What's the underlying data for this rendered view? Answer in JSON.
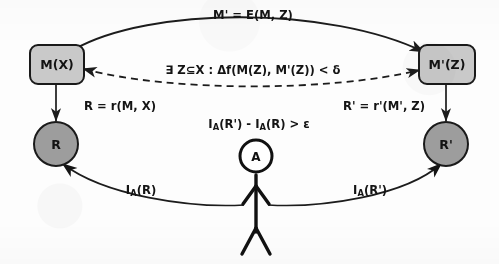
{
  "diagram": {
    "background_color": "#fdfdfd",
    "ink_color": "#1c1c1c",
    "box_fill": "#c9c9c9",
    "circle_fill": "#9d9d9d",
    "head_fill": "#ffffff"
  },
  "nodes": {
    "model_original": {
      "label": "M(X)",
      "shape": "rounded-rect",
      "fill": "#c9c9c9"
    },
    "model_extracted": {
      "label": "M'(Z)",
      "shape": "rounded-rect",
      "fill": "#c9c9c9"
    },
    "result_original": {
      "label": "R",
      "shape": "circle",
      "fill": "#9d9d9d"
    },
    "result_extracted": {
      "label": "R'",
      "shape": "circle",
      "fill": "#9d9d9d"
    },
    "actor": {
      "label": "A",
      "shape": "stick-figure",
      "fill": "#ffffff"
    }
  },
  "edges": {
    "extraction": {
      "label": "M' = E(M, Z)",
      "style": "solid",
      "direction": "left-to-right",
      "from": "M(X)",
      "to": "M'(Z)"
    },
    "fidelity": {
      "label_parts": {
        "exists": "∃",
        "subset": "Z⊆X",
        "colon": ":",
        "delta_f": "Δf(M(Z), M'(Z))",
        "less_than": "<",
        "delta": "δ"
      },
      "label": "∃ Z⊆X : Δf(M(Z), M'(Z)) < δ",
      "style": "dashed",
      "direction": "bidirectional",
      "from": "M(X)",
      "to": "M'(Z)"
    },
    "result_left": {
      "label": "R = r(M, X)",
      "style": "solid",
      "direction": "top-to-bottom",
      "from": "M(X)",
      "to": "R"
    },
    "result_right": {
      "label": "R' = r'(M', Z)",
      "style": "solid",
      "direction": "top-to-bottom",
      "from": "M'(Z)",
      "to": "R'"
    },
    "utility_gain": {
      "label_prefix": "I",
      "label_sub": "A",
      "label": "Iₐ(R') - Iₐ(R) > ε",
      "label_segments": [
        "I",
        "A",
        "(R') - ",
        "I",
        "A",
        "(R) > ε"
      ],
      "style": "annotation",
      "attached_to": "A"
    },
    "interest_left": {
      "label_segments": [
        "I",
        "A",
        "(R)"
      ],
      "label": "Iₐ(R)",
      "style": "solid",
      "direction": "actor-to-result",
      "from": "A",
      "to": "R"
    },
    "interest_right": {
      "label_segments": [
        "I",
        "A",
        "(R')"
      ],
      "label": "Iₐ(R')",
      "style": "solid",
      "direction": "actor-to-result",
      "from": "A",
      "to": "R'"
    }
  }
}
